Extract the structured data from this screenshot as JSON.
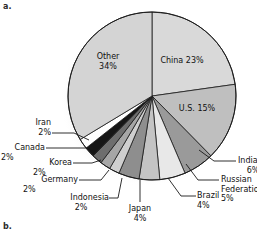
{
  "figure": {
    "panel_a_letter": "a.",
    "panel_b_letter": "b."
  },
  "chart_data": {
    "type": "pie",
    "title": "",
    "subtitle": "",
    "xlabel": "",
    "ylabel": "",
    "legend_position": "none",
    "grid": false,
    "units": "percent",
    "start_angle_deg": 0,
    "direction": "clockwise",
    "categories": [
      "China",
      "U.S.",
      "India",
      "Russian Federation",
      "Brazil",
      "Japan",
      "Indonesia",
      "Germany",
      "Korea",
      "Canada",
      "Iran",
      "Other"
    ],
    "values": [
      23,
      15,
      6,
      5,
      4,
      4,
      2,
      2,
      2,
      2,
      2,
      34
    ],
    "slices": [
      {
        "name": "China",
        "value": 23,
        "label": "China 23%",
        "label_line1": "China 23%",
        "label_line2": "",
        "color": "#d9d9d9",
        "placement": "inside"
      },
      {
        "name": "U.S.",
        "value": 15,
        "label": "U.S. 15%",
        "label_line1": "U.S. 15%",
        "label_line2": "",
        "color": "#bfbfbf",
        "placement": "inside"
      },
      {
        "name": "India",
        "value": 6,
        "label": "India 6%",
        "label_line1": "India",
        "label_line2": "6%",
        "color": "#9a9a9a",
        "placement": "callout-right"
      },
      {
        "name": "Russian Federation",
        "value": 5,
        "label": "Russian Federation 5%",
        "label_line1": "Russian",
        "label_line2": "Federation",
        "label_line3": "5%",
        "color": "#e8e8e8",
        "placement": "callout-right"
      },
      {
        "name": "Brazil",
        "value": 4,
        "label": "Brazil 4%",
        "label_line1": "Brazil",
        "label_line2": "4%",
        "color": "#c4c4c4",
        "placement": "callout-bottom"
      },
      {
        "name": "Japan",
        "value": 4,
        "label": "Japan 4%",
        "label_line1": "Japan",
        "label_line2": "4%",
        "color": "#8e8e8e",
        "placement": "callout-bottom"
      },
      {
        "name": "Indonesia",
        "value": 2,
        "label": "Indonesia 2%",
        "label_line1": "Indonesia",
        "label_line2": "2%",
        "color": "#cfcfcf",
        "placement": "callout-bottom"
      },
      {
        "name": "Germany",
        "value": 2,
        "label": "Germany 2%",
        "label_line1": "Germany",
        "label_line2": "2%",
        "color": "#a6a6a6",
        "placement": "callout-left"
      },
      {
        "name": "Korea",
        "value": 2,
        "label": "Korea 2%",
        "label_line1": "Korea",
        "label_line2": "2%",
        "color": "#6e6e6e",
        "placement": "callout-left"
      },
      {
        "name": "Canada",
        "value": 2,
        "label": "Canada 2%",
        "label_line1": "Canada",
        "label_line2": "2%",
        "color": "#161616",
        "placement": "callout-left"
      },
      {
        "name": "Iran",
        "value": 2,
        "label": "Iran 2%",
        "label_line1": "Iran",
        "label_line2": "2%",
        "color": "#ffffff",
        "placement": "callout-left"
      },
      {
        "name": "Other",
        "value": 34,
        "label": "Other 34%",
        "label_line1": "Other",
        "label_line2": "34%",
        "color": "#d4d4d4",
        "placement": "inside"
      }
    ]
  }
}
